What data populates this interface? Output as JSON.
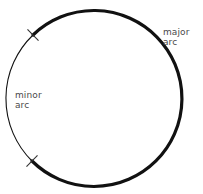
{
  "figure": {
    "type": "geometry-diagram",
    "background_color": "#ffffff",
    "stroke_color": "#111111",
    "text_color": "#4a4a4a"
  },
  "circle": {
    "center_x": 94,
    "center_y": 98,
    "radius": 88,
    "minor_arc_stroke_width": 1.1,
    "major_arc_stroke_width": 3.2
  },
  "endpoints": [
    {
      "name": "upper-endpoint",
      "x": 33,
      "y": 35,
      "tick_angle_deg": 45
    },
    {
      "name": "lower-endpoint",
      "x": 32,
      "y": 161,
      "tick_angle_deg": 135
    }
  ],
  "arcs": [
    {
      "id": "minor",
      "name": "minor arc",
      "weight": "thin",
      "side": "left",
      "start_angle_deg": 180,
      "end_angle_deg": 225
    },
    {
      "id": "major",
      "name": "major arc",
      "weight": "thick",
      "side": "right",
      "start_angle_deg": 225,
      "end_angle_deg": 180
    }
  ],
  "labels": {
    "major": {
      "line1": "major",
      "line2": "arc"
    },
    "minor": {
      "line1": "minor",
      "line2": "arc"
    }
  }
}
